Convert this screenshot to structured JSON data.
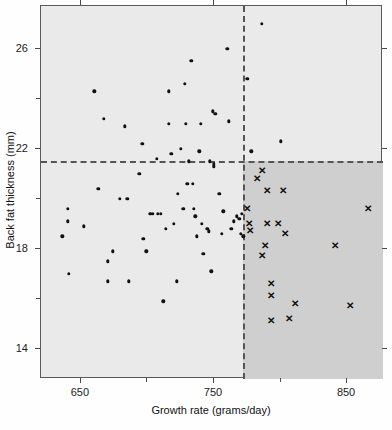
{
  "chart_data": {
    "type": "scatter",
    "title": "",
    "xlabel": "Growth rate (grams/day)",
    "ylabel": "Back fat thickness  (mm)",
    "xlim": [
      620,
      877
    ],
    "ylim": [
      12.8,
      27.7
    ],
    "xticks": [
      650,
      750,
      850
    ],
    "xtick_labels": [
      "650",
      "750",
      "850"
    ],
    "xminor_ticks": [
      700,
      800
    ],
    "yticks": [
      14,
      18,
      22,
      26
    ],
    "ytick_labels": [
      "14",
      "18",
      "22",
      "26"
    ],
    "yminor_ticks": [
      16,
      20,
      24
    ],
    "grid": false,
    "legend": "none",
    "annotations": {
      "vertical_threshold_label": "770",
      "horizontal_threshold_label": "21.5",
      "shaded_quadrant": "lower-right"
    },
    "reference_lines": [
      {
        "name": "growth-rate-threshold",
        "orientation": "vertical",
        "value": 772,
        "style": "dashed"
      },
      {
        "name": "back-fat-threshold",
        "orientation": "horizontal",
        "value": 21.5,
        "style": "dashed"
      }
    ],
    "series": [
      {
        "name": "dot-markers",
        "marker": "circle",
        "color": "#111111",
        "points": [
          [
            640,
            19.6
          ],
          [
            640,
            19.1
          ],
          [
            636,
            18.5
          ],
          [
            641,
            17.0
          ],
          [
            652,
            18.9
          ],
          [
            660,
            24.3
          ],
          [
            663,
            20.4
          ],
          [
            667,
            23.2
          ],
          [
            670,
            17.5
          ],
          [
            670,
            16.7
          ],
          [
            674,
            17.9
          ],
          [
            679,
            20.0
          ],
          [
            683,
            22.9
          ],
          [
            685,
            20.0
          ],
          [
            686,
            16.7
          ],
          [
            694,
            21.0
          ],
          [
            696,
            22.2
          ],
          [
            697,
            18.4
          ],
          [
            699,
            17.9
          ],
          [
            702,
            19.4
          ],
          [
            704,
            19.4
          ],
          [
            708,
            19.4
          ],
          [
            707,
            21.6
          ],
          [
            710,
            19.4
          ],
          [
            712,
            15.9
          ],
          [
            714,
            18.8
          ],
          [
            716,
            24.3
          ],
          [
            716,
            23.0
          ],
          [
            718,
            21.8
          ],
          [
            720,
            19.0
          ],
          [
            722,
            16.7
          ],
          [
            723,
            20.2
          ],
          [
            725,
            22.0
          ],
          [
            727,
            19.6
          ],
          [
            728,
            24.6
          ],
          [
            729,
            23.0
          ],
          [
            730,
            20.6
          ],
          [
            731,
            21.5
          ],
          [
            733,
            25.5
          ],
          [
            734,
            20.6
          ],
          [
            735,
            19.6
          ],
          [
            736,
            19.3
          ],
          [
            737,
            18.5
          ],
          [
            739,
            21.9
          ],
          [
            740,
            23.0
          ],
          [
            741,
            19.0
          ],
          [
            742,
            17.8
          ],
          [
            745,
            18.8
          ],
          [
            746,
            18.7
          ],
          [
            747,
            21.5
          ],
          [
            748,
            17.1
          ],
          [
            749,
            23.5
          ],
          [
            750,
            21.4
          ],
          [
            750,
            21.3
          ],
          [
            751,
            23.4
          ],
          [
            754,
            20.2
          ],
          [
            756,
            18.6
          ],
          [
            757,
            19.5
          ],
          [
            760,
            26.0
          ],
          [
            761,
            23.1
          ],
          [
            763,
            18.8
          ],
          [
            765,
            19.1
          ],
          [
            767,
            19.3
          ],
          [
            769,
            19.2
          ],
          [
            770,
            18.6
          ],
          [
            771,
            19.4
          ],
          [
            772,
            18.5
          ],
          [
            775,
            24.8
          ],
          [
            778,
            21.9
          ],
          [
            786,
            27.0
          ],
          [
            800,
            22.3
          ]
        ]
      },
      {
        "name": "x-markers",
        "marker": "x",
        "color": "#111111",
        "points": [
          [
            775,
            19.6
          ],
          [
            776,
            19.0
          ],
          [
            777,
            18.7
          ],
          [
            782,
            20.8
          ],
          [
            786,
            21.1
          ],
          [
            790,
            20.3
          ],
          [
            790,
            19.0
          ],
          [
            798,
            19.0
          ],
          [
            802,
            20.3
          ],
          [
            803,
            18.6
          ],
          [
            788,
            18.1
          ],
          [
            786,
            17.7
          ],
          [
            793,
            16.6
          ],
          [
            793,
            16.1
          ],
          [
            793,
            15.1
          ],
          [
            806,
            15.2
          ],
          [
            811,
            15.8
          ],
          [
            841,
            18.1
          ],
          [
            852,
            15.7
          ],
          [
            866,
            19.6
          ]
        ]
      }
    ]
  },
  "axis_titles": {
    "x": "Growth rate (grams/day)",
    "y": "Back fat thickness  (mm)"
  }
}
